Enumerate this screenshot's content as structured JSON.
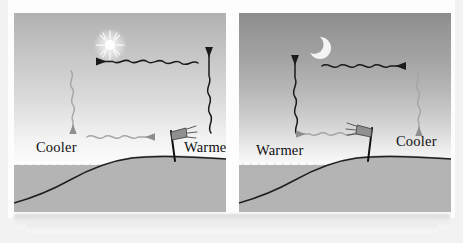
{
  "figure": {
    "type": "diagram",
    "panels": [
      {
        "id": "day",
        "sky_state": "day",
        "celestial_icon": "sun-icon",
        "flag_direction": "right",
        "labels": [
          {
            "id": "cooler",
            "text": "Cooler",
            "side": "left-over-water"
          },
          {
            "id": "warmer",
            "text": "Warmer",
            "side": "right-over-land"
          }
        ],
        "arrows": [
          {
            "id": "upper-horizontal",
            "style": "wavy",
            "direction": "left"
          },
          {
            "id": "left-vertical",
            "style": "wavy",
            "direction": "down"
          },
          {
            "id": "lower-horizontal",
            "style": "wavy",
            "direction": "right"
          },
          {
            "id": "right-vertical",
            "style": "wavy",
            "direction": "up"
          }
        ]
      },
      {
        "id": "night",
        "sky_state": "night",
        "celestial_icon": "crescent-moon-icon",
        "flag_direction": "left",
        "labels": [
          {
            "id": "warmer",
            "text": "Warmer",
            "side": "left-over-water"
          },
          {
            "id": "cooler",
            "text": "Cooler",
            "side": "right-over-land"
          }
        ],
        "arrows": [
          {
            "id": "upper-horizontal",
            "style": "wavy",
            "direction": "right"
          },
          {
            "id": "left-vertical",
            "style": "wavy",
            "direction": "up"
          },
          {
            "id": "lower-horizontal",
            "style": "wavy",
            "direction": "left"
          },
          {
            "id": "right-vertical",
            "style": "wavy",
            "direction": "down"
          }
        ]
      }
    ]
  },
  "colors": {
    "ground": "#b4b4b4",
    "sky_day_top": "#b1b1b1",
    "sky_night_top": "#8d8d8d",
    "ink": "#111111",
    "arrow_light": "#9a9a9a",
    "page": "#f2f2f2",
    "sheet": "#fdfdfd"
  },
  "panel_day": {
    "cooler_label": "Cooler",
    "warmer_label": "Warmer"
  },
  "panel_night": {
    "warmer_label": "Warmer",
    "cooler_label": "Cooler"
  }
}
